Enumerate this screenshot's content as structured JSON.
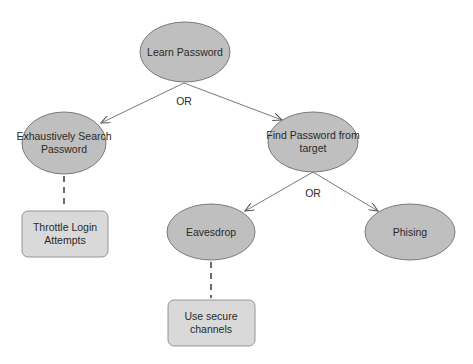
{
  "diagram": {
    "title": "",
    "nodes": {
      "root": {
        "label": "Learn Password",
        "shape": "ellipse"
      },
      "exhaustive": {
        "label": "Exhaustively Search\nPassword",
        "shape": "ellipse"
      },
      "find_target": {
        "label": "Find Password from\ntarget",
        "shape": "ellipse"
      },
      "eavesdrop": {
        "label": "Eavesdrop",
        "shape": "ellipse"
      },
      "phishing": {
        "label": "Phising",
        "shape": "ellipse"
      },
      "throttle": {
        "label": "Throttle Login\nAttempts",
        "shape": "rounded-box"
      },
      "secure_channels": {
        "label": "Use secure\nchannels",
        "shape": "rounded-box"
      }
    },
    "operators": {
      "root_or": "OR",
      "find_target_or": "OR"
    },
    "edges": [
      {
        "from": "root",
        "to": "exhaustive",
        "style": "arrow"
      },
      {
        "from": "root",
        "to": "find_target",
        "style": "arrow"
      },
      {
        "from": "find_target",
        "to": "eavesdrop",
        "style": "arrow"
      },
      {
        "from": "find_target",
        "to": "phishing",
        "style": "arrow"
      },
      {
        "from": "exhaustive",
        "to": "throttle",
        "style": "dashed"
      },
      {
        "from": "eavesdrop",
        "to": "secure_channels",
        "style": "dashed"
      }
    ],
    "colors": {
      "ellipse_fill": "#bfbfbf",
      "box_fill": "#d9d9d9",
      "stroke": "#6e6e6e",
      "text": "#2a2a2a"
    }
  }
}
